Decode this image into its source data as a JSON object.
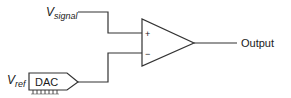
{
  "diagram": {
    "type": "comparator-circuit",
    "inputs": {
      "signal": {
        "main": "V",
        "subscript": "signal"
      },
      "reference": {
        "main": "V",
        "subscript": "ref"
      }
    },
    "dac": {
      "label": "DAC"
    },
    "opamp": {
      "plus": "+",
      "minus": "−"
    },
    "output": {
      "label": "Output"
    },
    "colors": {
      "stroke": "#333333",
      "text": "#1a1a1a",
      "background": "#ffffff"
    }
  }
}
